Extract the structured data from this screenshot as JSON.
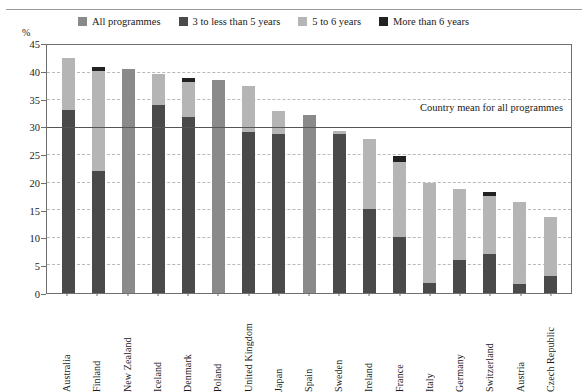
{
  "unit_label": "%",
  "legend": [
    {
      "label": "All programmes",
      "color": "#8a8a8a",
      "key": "all_programmes"
    },
    {
      "label": "3 to less than 5 years",
      "color": "#4a4a4a",
      "key": "y3_to_5"
    },
    {
      "label": "5 to 6 years",
      "color": "#b5b5b5",
      "key": "y5_to_6"
    },
    {
      "label": "More than 6 years",
      "color": "#222222",
      "key": "more_than_6"
    }
  ],
  "annotation": {
    "mean_label": "Country mean for all programmes",
    "mean_value": 30
  },
  "chart_data": {
    "type": "bar",
    "title": "",
    "xlabel": "",
    "ylabel": "%",
    "ylim": [
      0,
      45
    ],
    "ytick_step": 5,
    "yticks": [
      0,
      5,
      10,
      15,
      20,
      25,
      30,
      35,
      40,
      45
    ],
    "grid": true,
    "legend_position": "top",
    "stacked": true,
    "categories": [
      "Australia",
      "Finland",
      "New Zealand",
      "Iceland",
      "Denmark",
      "Poland",
      "United Kingdom",
      "Japan",
      "Spain",
      "Sweden",
      "Ireland",
      "France",
      "Italy",
      "Germany",
      "Switzerland",
      "Austria",
      "Czech Republic"
    ],
    "series": [
      {
        "name": "All programmes",
        "color": "#8a8a8a",
        "values": [
          42.3,
          40.7,
          40.4,
          39.5,
          38.7,
          38.4,
          37.2,
          32.7,
          32.0,
          29.2,
          27.8,
          24.6,
          19.8,
          18.7,
          18.2,
          16.4,
          13.7
        ]
      },
      {
        "name": "3 to less than 5 years",
        "color": "#4a4a4a",
        "values": [
          33.0,
          22.0,
          null,
          33.9,
          31.7,
          null,
          28.9,
          28.7,
          null,
          28.6,
          15.2,
          10.0,
          1.8,
          6.0,
          7.0,
          1.6,
          3.0
        ]
      },
      {
        "name": "5 to 6 years",
        "color": "#b5b5b5",
        "values": [
          42.3,
          40.0,
          null,
          39.5,
          37.9,
          null,
          37.2,
          32.7,
          null,
          29.2,
          27.8,
          23.6,
          19.8,
          18.7,
          17.5,
          16.4,
          13.7
        ]
      },
      {
        "name": "More than 6 years",
        "color": "#222222",
        "values": [
          null,
          40.7,
          null,
          null,
          38.7,
          null,
          null,
          null,
          null,
          null,
          null,
          24.6,
          null,
          null,
          18.2,
          null,
          null
        ]
      }
    ],
    "bar_segments": [
      {
        "category": "Australia",
        "segments": [
          {
            "series": "More than 6 years",
            "from": 0,
            "to": 33.0,
            "color": "#4a4a4a"
          },
          {
            "series": "5 to 6 years",
            "from": 33.0,
            "to": 42.3,
            "color": "#b5b5b5"
          }
        ]
      },
      {
        "category": "Finland",
        "segments": [
          {
            "series": "More than 6 years",
            "from": 0,
            "to": 22.0,
            "color": "#4a4a4a"
          },
          {
            "series": "5 to 6 years",
            "from": 22.0,
            "to": 40.0,
            "color": "#b5b5b5"
          },
          {
            "series": "More than 6 years cap",
            "from": 40.0,
            "to": 40.7,
            "color": "#222222"
          }
        ]
      },
      {
        "category": "New Zealand",
        "segments": [
          {
            "series": "All programmes",
            "from": 0,
            "to": 40.4,
            "color": "#8a8a8a"
          }
        ]
      },
      {
        "category": "Iceland",
        "segments": [
          {
            "series": "More than 6 years",
            "from": 0,
            "to": 33.9,
            "color": "#4a4a4a"
          },
          {
            "series": "5 to 6 years",
            "from": 33.9,
            "to": 39.5,
            "color": "#b5b5b5"
          }
        ]
      },
      {
        "category": "Denmark",
        "segments": [
          {
            "series": "More than 6 years",
            "from": 0,
            "to": 31.7,
            "color": "#4a4a4a"
          },
          {
            "series": "5 to 6 years",
            "from": 31.7,
            "to": 37.9,
            "color": "#b5b5b5"
          },
          {
            "series": "More than 6 years cap",
            "from": 37.9,
            "to": 38.7,
            "color": "#222222"
          }
        ]
      },
      {
        "category": "Poland",
        "segments": [
          {
            "series": "All programmes",
            "from": 0,
            "to": 38.4,
            "color": "#8a8a8a"
          }
        ]
      },
      {
        "category": "United Kingdom",
        "segments": [
          {
            "series": "More than 6 years",
            "from": 0,
            "to": 28.9,
            "color": "#4a4a4a"
          },
          {
            "series": "5 to 6 years",
            "from": 28.9,
            "to": 37.2,
            "color": "#b5b5b5"
          }
        ]
      },
      {
        "category": "Japan",
        "segments": [
          {
            "series": "More than 6 years",
            "from": 0,
            "to": 28.7,
            "color": "#4a4a4a"
          },
          {
            "series": "5 to 6 years",
            "from": 28.7,
            "to": 32.7,
            "color": "#b5b5b5"
          }
        ]
      },
      {
        "category": "Spain",
        "segments": [
          {
            "series": "All programmes",
            "from": 0,
            "to": 32.0,
            "color": "#8a8a8a"
          }
        ]
      },
      {
        "category": "Sweden",
        "segments": [
          {
            "series": "More than 6 years",
            "from": 0,
            "to": 28.6,
            "color": "#4a4a4a"
          },
          {
            "series": "5 to 6 years",
            "from": 28.6,
            "to": 29.2,
            "color": "#b5b5b5"
          }
        ]
      },
      {
        "category": "Ireland",
        "segments": [
          {
            "series": "More than 6 years",
            "from": 0,
            "to": 15.2,
            "color": "#4a4a4a"
          },
          {
            "series": "5 to 6 years",
            "from": 15.2,
            "to": 27.8,
            "color": "#b5b5b5"
          }
        ]
      },
      {
        "category": "France",
        "segments": [
          {
            "series": "More than 6 years",
            "from": 0,
            "to": 10.0,
            "color": "#4a4a4a"
          },
          {
            "series": "5 to 6 years",
            "from": 10.0,
            "to": 23.6,
            "color": "#b5b5b5"
          },
          {
            "series": "More than 6 years cap",
            "from": 23.6,
            "to": 24.6,
            "color": "#222222"
          }
        ]
      },
      {
        "category": "Italy",
        "segments": [
          {
            "series": "More than 6 years",
            "from": 0,
            "to": 1.8,
            "color": "#4a4a4a"
          },
          {
            "series": "5 to 6 years",
            "from": 1.8,
            "to": 19.8,
            "color": "#b5b5b5"
          }
        ]
      },
      {
        "category": "Germany",
        "segments": [
          {
            "series": "More than 6 years",
            "from": 0,
            "to": 6.0,
            "color": "#4a4a4a"
          },
          {
            "series": "5 to 6 years",
            "from": 6.0,
            "to": 18.7,
            "color": "#b5b5b5"
          }
        ]
      },
      {
        "category": "Switzerland",
        "segments": [
          {
            "series": "More than 6 years",
            "from": 0,
            "to": 7.0,
            "color": "#4a4a4a"
          },
          {
            "series": "5 to 6 years",
            "from": 7.0,
            "to": 17.5,
            "color": "#b5b5b5"
          },
          {
            "series": "More than 6 years cap",
            "from": 17.5,
            "to": 18.2,
            "color": "#222222"
          }
        ]
      },
      {
        "category": "Austria",
        "segments": [
          {
            "series": "More than 6 years",
            "from": 0,
            "to": 1.6,
            "color": "#4a4a4a"
          },
          {
            "series": "5 to 6 years",
            "from": 1.6,
            "to": 16.4,
            "color": "#b5b5b5"
          }
        ]
      },
      {
        "category": "Czech Republic",
        "segments": [
          {
            "series": "More than 6 years",
            "from": 0,
            "to": 3.0,
            "color": "#4a4a4a"
          },
          {
            "series": "5 to 6 years",
            "from": 3.0,
            "to": 13.7,
            "color": "#b5b5b5"
          }
        ]
      }
    ]
  }
}
